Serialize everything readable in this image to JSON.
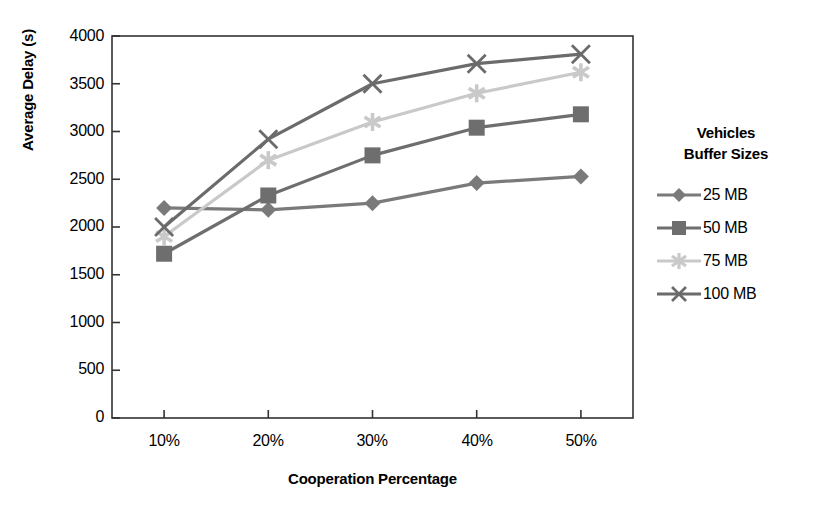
{
  "chart_data": {
    "type": "line",
    "title": "",
    "xlabel": "Cooperation Percentage",
    "ylabel": "Average Delay (s)",
    "categories": [
      "10%",
      "20%",
      "30%",
      "40%",
      "50%"
    ],
    "x_tick_labels": [
      "10%",
      "20%",
      "30%",
      "40%",
      "50%"
    ],
    "y_tick_labels": [
      "0",
      "500",
      "1000",
      "1500",
      "2000",
      "2500",
      "3000",
      "3500",
      "4000"
    ],
    "y_ticks": [
      0,
      500,
      1000,
      1500,
      2000,
      2500,
      3000,
      3500,
      4000
    ],
    "ylim": [
      0,
      4000
    ],
    "grid": false,
    "legend_position": "right",
    "legend_title": "Vehicles\nBuffer Sizes",
    "legend_title_line1": "Vehicles",
    "legend_title_line2": "Buffer Sizes",
    "series": [
      {
        "name": "25 MB",
        "marker": "diamond",
        "color": "#7a7a7a",
        "values": [
          2200,
          2180,
          2250,
          2460,
          2530
        ]
      },
      {
        "name": "50 MB",
        "marker": "square",
        "color": "#6e6e6e",
        "values": [
          1720,
          2330,
          2750,
          3040,
          3180
        ]
      },
      {
        "name": "75 MB",
        "marker": "star",
        "color": "#c9c9c9",
        "values": [
          1900,
          2700,
          3100,
          3400,
          3620
        ]
      },
      {
        "name": "100 MB",
        "marker": "cross-x",
        "color": "#6b6b6b",
        "values": [
          2000,
          2920,
          3500,
          3710,
          3810
        ]
      }
    ]
  },
  "colors": {
    "axis": "#333333",
    "plot_border": "#333333",
    "text": "#000000",
    "series_25mb": "#7a7a7a",
    "series_50mb": "#6e6e6e",
    "series_75mb": "#c9c9c9",
    "series_100mb": "#6b6b6b"
  }
}
